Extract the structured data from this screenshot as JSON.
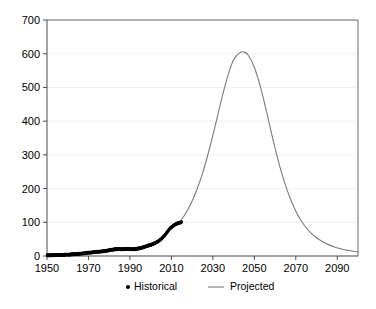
{
  "chart_data": {
    "type": "line",
    "title": "",
    "subtitle": "",
    "xlabel": "",
    "ylabel": "",
    "xlim": [
      1950,
      2100
    ],
    "ylim": [
      0,
      700
    ],
    "grid": true,
    "legend_position": "bottom",
    "x_ticks": [
      "1950",
      "1970",
      "1990",
      "2010",
      "2030",
      "2050",
      "2070",
      "2090"
    ],
    "x_tick_values": [
      1950,
      1970,
      1990,
      2010,
      2030,
      2050,
      2070,
      2090
    ],
    "y_ticks": [
      "0",
      "100",
      "200",
      "300",
      "400",
      "500",
      "600",
      "700"
    ],
    "y_tick_values": [
      0,
      100,
      200,
      300,
      400,
      500,
      600,
      700
    ],
    "series": [
      {
        "name": "Historical",
        "style": "points",
        "color": "#000000",
        "x": [
          1950,
          1951,
          1952,
          1953,
          1954,
          1955,
          1956,
          1957,
          1958,
          1959,
          1960,
          1961,
          1962,
          1963,
          1964,
          1965,
          1966,
          1967,
          1968,
          1969,
          1970,
          1971,
          1972,
          1973,
          1974,
          1975,
          1976,
          1977,
          1978,
          1979,
          1980,
          1981,
          1982,
          1983,
          1984,
          1985,
          1986,
          1987,
          1988,
          1989,
          1990,
          1991,
          1992,
          1993,
          1994,
          1995,
          1996,
          1997,
          1998,
          1999,
          2000,
          2001,
          2002,
          2003,
          2004,
          2005,
          2006,
          2007,
          2008,
          2009,
          2010,
          2011,
          2012,
          2013,
          2014,
          2015
        ],
        "values": [
          2,
          2,
          2,
          2,
          3,
          3,
          3,
          3,
          3,
          4,
          4,
          4,
          5,
          5,
          6,
          6,
          7,
          7,
          8,
          9,
          10,
          10,
          11,
          12,
          12,
          13,
          13,
          14,
          15,
          16,
          17,
          18,
          19,
          20,
          20,
          21,
          20,
          20,
          21,
          21,
          21,
          20,
          20,
          21,
          22,
          23,
          25,
          27,
          29,
          31,
          33,
          35,
          38,
          41,
          45,
          50,
          56,
          63,
          71,
          79,
          85,
          90,
          94,
          97,
          99,
          100
        ]
      },
      {
        "name": "Projected",
        "style": "line",
        "color": "#7a7a7a",
        "x": [
          2013,
          2016,
          2019,
          2022,
          2025,
          2028,
          2031,
          2034,
          2037,
          2040,
          2043,
          2045,
          2047,
          2050,
          2053,
          2056,
          2059,
          2062,
          2065,
          2068,
          2071,
          2074,
          2077,
          2080,
          2083,
          2086,
          2089,
          2092,
          2095,
          2098,
          2100
        ],
        "values": [
          95,
          118,
          150,
          192,
          245,
          310,
          383,
          460,
          530,
          582,
          603,
          605,
          596,
          560,
          500,
          425,
          345,
          272,
          210,
          160,
          121,
          92,
          70,
          54,
          42,
          33,
          26,
          21,
          17,
          14,
          12
        ]
      }
    ],
    "legend": [
      {
        "label": "Historical",
        "marker": "dot",
        "color": "#000000"
      },
      {
        "label": "Projected",
        "marker": "line",
        "color": "#7a7a7a"
      }
    ]
  }
}
